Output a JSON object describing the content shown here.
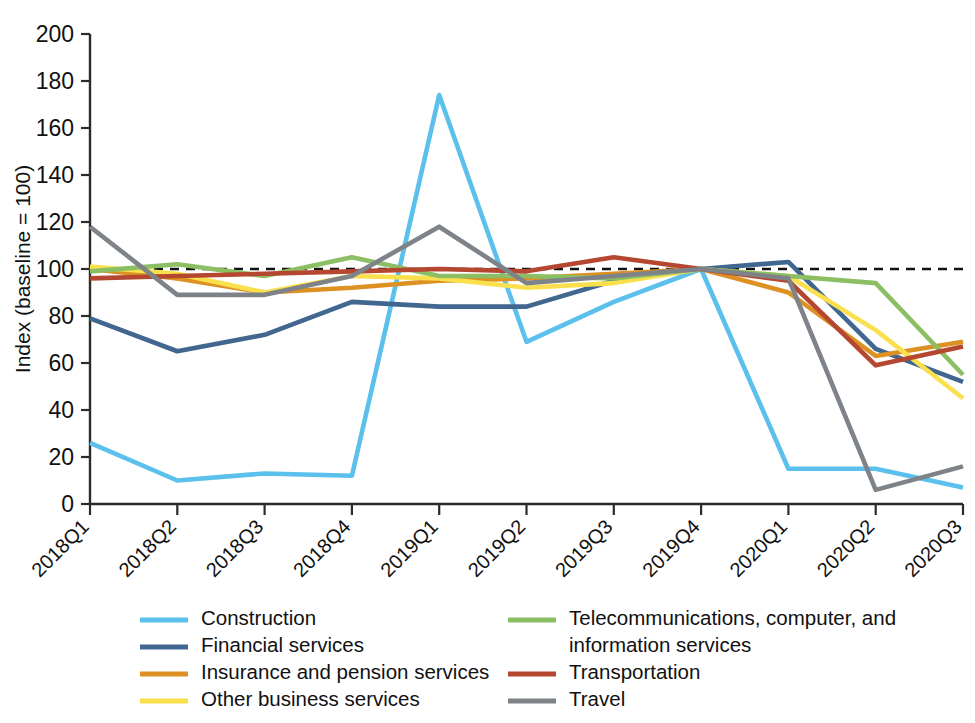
{
  "chart_data": {
    "type": "line",
    "title": "",
    "xlabel": "",
    "ylabel": "Index (baseline = 100)",
    "ylim": [
      0,
      200
    ],
    "ytick_step": 20,
    "yticks": [
      "0",
      "20",
      "40",
      "60",
      "80",
      "100",
      "120",
      "140",
      "160",
      "180",
      "200"
    ],
    "grid": false,
    "legend_position": "bottom",
    "baseline": 100,
    "baseline_style": "dashed",
    "categories": [
      "2018Q1",
      "2018Q2",
      "2018Q3",
      "2018Q4",
      "2019Q1",
      "2019Q2",
      "2019Q3",
      "2019Q4",
      "2020Q1",
      "2020Q2",
      "2020Q3"
    ],
    "series": [
      {
        "name": "Construction",
        "color": "#5BC0EB",
        "values": [
          26,
          10,
          13,
          12,
          174,
          69,
          86,
          100,
          15,
          15,
          7
        ]
      },
      {
        "name": "Financial services",
        "color": "#41668F",
        "values": [
          79,
          65,
          72,
          86,
          84,
          84,
          95,
          100,
          103,
          66,
          52
        ]
      },
      {
        "name": "Insurance and pension services",
        "color": "#DE9123",
        "values": [
          100,
          96,
          90,
          92,
          95,
          96,
          98,
          100,
          90,
          63,
          69
        ]
      },
      {
        "name": "Other business services",
        "color": "#F9E04C",
        "values": [
          101,
          98,
          90,
          97,
          96,
          92,
          94,
          100,
          97,
          74,
          45
        ]
      },
      {
        "name": "Telecommunications, computer, and information services",
        "color": "#8CBF63",
        "values": [
          99,
          102,
          97,
          105,
          97,
          97,
          96,
          100,
          97,
          94,
          55
        ]
      },
      {
        "name": "Transportation",
        "color": "#B5462F",
        "values": [
          96,
          97,
          98,
          99,
          100,
          99,
          105,
          100,
          95,
          59,
          67
        ]
      },
      {
        "name": "Travel",
        "color": "#7E8389",
        "values": [
          118,
          89,
          89,
          97,
          118,
          94,
          97,
          100,
          96,
          6,
          16
        ]
      }
    ]
  },
  "legend": {
    "left_column": [
      "Construction",
      "Financial services",
      "Insurance and pension services",
      "Other business services"
    ],
    "right_column": [
      "Telecommunications, computer, and",
      "information services",
      "Transportation",
      "Travel"
    ]
  }
}
